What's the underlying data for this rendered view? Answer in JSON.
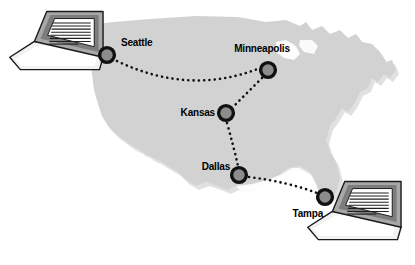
{
  "diagram": {
    "background_color": "#ffffff",
    "map": {
      "name": "continental-united-states",
      "fill_color": "#d2d2d2",
      "shadow_color": "#c4c4c4"
    },
    "node_style": {
      "ring_color": "#111111",
      "fill_color": "#8c8c8c",
      "ring_width": 3.4,
      "radius": 7.5
    },
    "link_style": {
      "color": "#111111",
      "dot_size": 2.2,
      "pattern": "dotted"
    },
    "cities": [
      {
        "id": "seattle",
        "label": "Seattle",
        "x": 107,
        "y": 55,
        "label_x": 121,
        "label_y": 46,
        "label_anchor": "start"
      },
      {
        "id": "minneapolis",
        "label": "Minneapolis",
        "x": 268,
        "y": 70,
        "label_x": 262,
        "label_y": 52,
        "label_anchor": "middle"
      },
      {
        "id": "kansas",
        "label": "Kansas",
        "x": 226,
        "y": 113,
        "label_x": 218,
        "label_y": 113,
        "label_anchor": "end"
      },
      {
        "id": "dallas",
        "label": "Dallas",
        "x": 239,
        "y": 175,
        "label_x": 231,
        "label_y": 169,
        "label_anchor": "end"
      },
      {
        "id": "tampa",
        "label": "Tampa",
        "x": 325,
        "y": 197,
        "label_x": 322,
        "label_y": 216,
        "label_anchor": "end"
      }
    ],
    "links": [
      {
        "id": "seattle-minneapolis",
        "from": "Seattle",
        "to": "Minneapolis"
      },
      {
        "id": "minneapolis-kansas",
        "from": "Minneapolis",
        "to": "Kansas"
      },
      {
        "id": "kansas-dallas",
        "from": "Kansas",
        "to": "Dallas"
      },
      {
        "id": "dallas-tampa",
        "from": "Dallas",
        "to": "Tampa"
      }
    ],
    "laptops": [
      {
        "id": "laptop-top-left",
        "position": "top-left",
        "screen_lines": 9,
        "bezel_color": "#8e8e8e",
        "screen_color": "#ffffff",
        "base_color": "#ededed",
        "line_color": "#222222"
      },
      {
        "id": "laptop-bottom-right",
        "position": "bottom-right",
        "screen_lines": 9,
        "bezel_color": "#8e8e8e",
        "screen_color": "#ffffff",
        "base_color": "#ededed",
        "line_color": "#222222"
      }
    ]
  }
}
